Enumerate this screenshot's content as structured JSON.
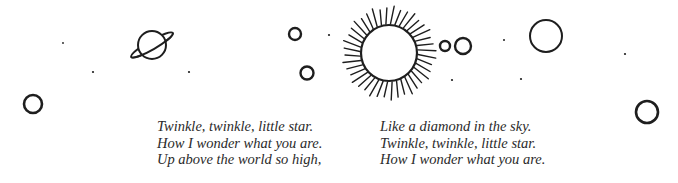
{
  "poem": {
    "left_stanza": [
      "Twinkle, twinkle, little star.",
      "How I wonder what you are.",
      "Up above the world so high,"
    ],
    "right_stanza": [
      "Like a diamond in the sky.",
      "Twinkle, twinkle, little star.",
      "How I wonder what you are."
    ]
  },
  "illustration": {
    "ink_color": "#1e1e1e",
    "background": "#ffffff",
    "sun": {
      "cx": 389,
      "cy": 53,
      "r": 28,
      "ray_outer": 45,
      "ray_count": 40
    },
    "saturn": {
      "cx": 152,
      "cy": 45,
      "r": 14
    },
    "circles": [
      {
        "cx": 33,
        "cy": 104,
        "r": 9,
        "stroke": 2.6
      },
      {
        "cx": 295,
        "cy": 34,
        "r": 6,
        "stroke": 2.4
      },
      {
        "cx": 307,
        "cy": 73,
        "r": 6.5,
        "stroke": 2.4
      },
      {
        "cx": 445,
        "cy": 46,
        "r": 5,
        "stroke": 2.4
      },
      {
        "cx": 463,
        "cy": 46,
        "r": 8,
        "stroke": 2.4
      },
      {
        "cx": 546,
        "cy": 36,
        "r": 16,
        "stroke": 2
      },
      {
        "cx": 647,
        "cy": 112,
        "r": 11,
        "stroke": 2.6
      }
    ],
    "dots": [
      {
        "cx": 63,
        "cy": 43,
        "r": 0.9
      },
      {
        "cx": 93,
        "cy": 72,
        "r": 1.1
      },
      {
        "cx": 189,
        "cy": 72,
        "r": 1.1
      },
      {
        "cx": 329,
        "cy": 35,
        "r": 1.1
      },
      {
        "cx": 452,
        "cy": 80,
        "r": 1.1
      },
      {
        "cx": 504,
        "cy": 40,
        "r": 1.0
      },
      {
        "cx": 521,
        "cy": 79,
        "r": 1.1
      },
      {
        "cx": 625,
        "cy": 54,
        "r": 1.1
      }
    ]
  }
}
